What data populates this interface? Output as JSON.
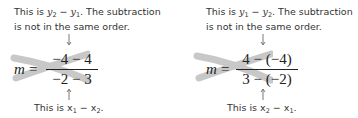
{
  "left": {
    "top_note_line1_prefix": "This is ",
    "top_note_var_a": "y",
    "top_note_sub_a": "2",
    "top_note_minus": " − ",
    "top_note_var_b": "y",
    "top_note_sub_b": "1",
    "top_note_line1_suffix": ". The subtraction",
    "top_note_line2": "is not in the same order.",
    "lhs": "m",
    "equals": "=",
    "numerator": "−4 − 4",
    "denominator": "−2 − 3",
    "bottom_note_prefix": "This is ",
    "bottom_var_a": "x",
    "bottom_sub_a": "1",
    "bottom_minus": " − ",
    "bottom_var_b": "x",
    "bottom_sub_b": "2",
    "bottom_suffix": "."
  },
  "right": {
    "top_note_line1_prefix": "This is ",
    "top_note_var_a": "y",
    "top_note_sub_a": "1",
    "top_note_minus": " − ",
    "top_note_var_b": "y",
    "top_note_sub_b": "2",
    "top_note_line1_suffix": ". The subtraction",
    "top_note_line2": "is not in the same order.",
    "lhs": "m",
    "equals": "=",
    "numerator": "4 − (−4)",
    "denominator": "3 − (−2)",
    "bottom_note_prefix": "This is ",
    "bottom_var_a": "x",
    "bottom_sub_a": "2",
    "bottom_minus": " − ",
    "bottom_var_b": "x",
    "bottom_sub_b": "1",
    "bottom_suffix": "."
  },
  "colors": {
    "cross_out": "#c8c8c8",
    "text": "#333333"
  }
}
